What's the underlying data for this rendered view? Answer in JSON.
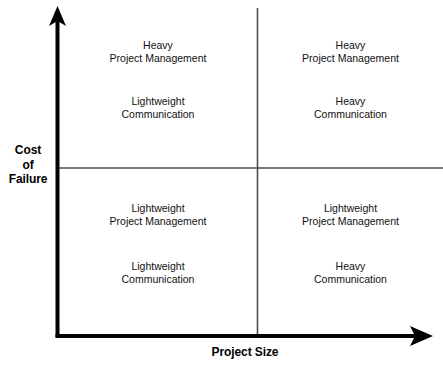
{
  "diagram": {
    "type": "2x2-matrix",
    "x_axis": {
      "label": "Project Size",
      "direction": "increasing-right"
    },
    "y_axis": {
      "label_lines": [
        "Cost",
        "of",
        "Failure"
      ],
      "line1": "Cost",
      "line2": "of",
      "line3": "Failure",
      "direction": "increasing-up"
    },
    "quadrants": {
      "top_left": {
        "position": "small project size, high cost of failure",
        "block_a": {
          "line1": "Heavy",
          "line2": "Project Management"
        },
        "block_b": {
          "line1": "Lightweight",
          "line2": "Communication"
        }
      },
      "top_right": {
        "position": "large project size, high cost of failure",
        "block_a": {
          "line1": "Heavy",
          "line2": "Project Management"
        },
        "block_b": {
          "line1": "Heavy",
          "line2": "Communication"
        }
      },
      "bottom_left": {
        "position": "small project size, low cost of failure",
        "block_a": {
          "line1": "Lightweight",
          "line2": "Project Management"
        },
        "block_b": {
          "line1": "Lightweight",
          "line2": "Communication"
        }
      },
      "bottom_right": {
        "position": "large project size, low cost of failure",
        "block_a": {
          "line1": "Lightweight",
          "line2": "Project Management"
        },
        "block_b": {
          "line1": "Heavy",
          "line2": "Communication"
        }
      }
    },
    "colors": {
      "axis": "#000000",
      "divider": "#4d4d4d",
      "text": "#111111",
      "background": "#ffffff"
    }
  }
}
